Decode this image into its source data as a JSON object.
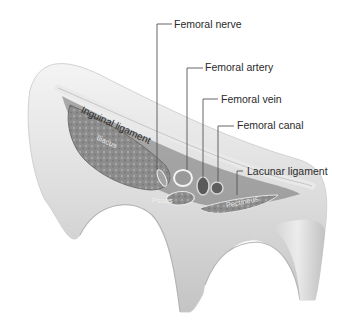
{
  "diagram": {
    "type": "anatomical cross-section",
    "labels": [
      {
        "id": "femoral_nerve",
        "text": "Femoral nerve"
      },
      {
        "id": "femoral_artery",
        "text": "Femoral artery"
      },
      {
        "id": "femoral_vein",
        "text": "Femoral vein"
      },
      {
        "id": "femoral_canal",
        "text": "Femoral canal"
      },
      {
        "id": "lacunar_ligament",
        "text": "Lacunar ligament"
      },
      {
        "id": "inguinal_ligament",
        "text": "Inguinal ligament"
      }
    ],
    "muscle_labels": [
      {
        "id": "iliacus",
        "text": "Iliacus"
      },
      {
        "id": "psoas",
        "text": "Psoas"
      },
      {
        "id": "pectineus",
        "text": "Pectineus"
      }
    ],
    "colors": {
      "background": "#ffffff",
      "bone_light": "#efefef",
      "bone_shadow": "#b8b8b8",
      "muscle": "#8f8f8f",
      "leader_line": "#555555",
      "label_text": "#2a2a2a"
    }
  }
}
